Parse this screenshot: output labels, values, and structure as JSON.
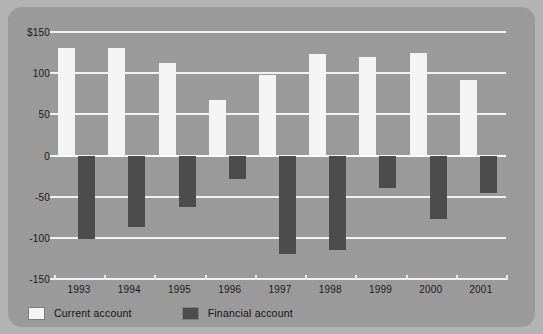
{
  "chart_data": {
    "type": "bar",
    "title": "",
    "subtitle": "",
    "xlabel": "",
    "ylabel": "",
    "categories": [
      "1993",
      "1994",
      "1995",
      "1996",
      "1997",
      "1998",
      "1999",
      "2000",
      "2001"
    ],
    "series": [
      {
        "name": "Current account",
        "color": "#f4f4f4",
        "values": [
          131,
          131,
          112,
          68,
          98,
          123,
          120,
          125,
          92
        ]
      },
      {
        "name": "Financial account",
        "color": "#4c4c4c",
        "values": [
          -102,
          -87,
          -63,
          -28,
          -120,
          -115,
          -40,
          -77,
          -46
        ]
      }
    ],
    "ylim": [
      -150,
      150
    ],
    "yticks": [
      150,
      100,
      50,
      0,
      -50,
      -100,
      -150
    ],
    "ytick_labels": [
      "$150",
      "100",
      "50",
      "0",
      "-50",
      "-100",
      "-150"
    ],
    "grid": true,
    "legend_position": "bottom-left",
    "annotations": []
  },
  "legend": {
    "entries": [
      {
        "label": "Current account",
        "swatch": "current"
      },
      {
        "label": "Financial account",
        "swatch": "financial"
      }
    ]
  },
  "colors": {
    "page_background": "#b3b3b3",
    "card_background": "#9a9a9a",
    "gridline": "#f2f2f2",
    "text": "#1b1b1b",
    "current_account": "#f4f4f4",
    "financial_account": "#4c4c4c"
  }
}
